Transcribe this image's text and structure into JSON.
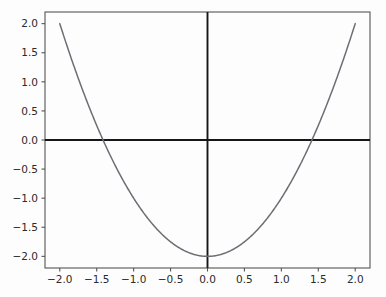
{
  "figure": {
    "background_color": "#fdfdfd",
    "width": 386,
    "height": 297
  },
  "chart_data": {
    "type": "line",
    "title": "",
    "xlabel": "",
    "ylabel": "",
    "expression": "y = x^2 - 2",
    "xlim": [
      -2.2,
      2.2
    ],
    "ylim": [
      -2.2,
      2.2
    ],
    "grid": false,
    "legend": null,
    "axis_lines": {
      "horizontal_at_y": 0.0,
      "vertical_at_x": 0.0,
      "color": "#161616"
    },
    "series": [
      {
        "name": "y = x^2 - 2",
        "color": "#6d6d75",
        "linewidth": 1.5,
        "x": [
          -2.0,
          -1.9,
          -1.8,
          -1.7,
          -1.6,
          -1.5,
          -1.4,
          -1.3,
          -1.2,
          -1.1,
          -1.0,
          -0.9,
          -0.8,
          -0.7,
          -0.6,
          -0.5,
          -0.4,
          -0.3,
          -0.2,
          -0.1,
          0.0,
          0.1,
          0.2,
          0.3,
          0.4,
          0.5,
          0.6,
          0.7,
          0.8,
          0.9,
          1.0,
          1.1,
          1.2,
          1.3,
          1.4,
          1.5,
          1.6,
          1.7,
          1.8,
          1.9,
          2.0
        ],
        "y": [
          2.0,
          1.61,
          1.24,
          0.89,
          0.56,
          0.25,
          -0.04,
          -0.31,
          -0.56,
          -0.79,
          -1.0,
          -1.19,
          -1.36,
          -1.51,
          -1.64,
          -1.75,
          -1.84,
          -1.91,
          -1.96,
          -1.99,
          -2.0,
          -1.99,
          -1.96,
          -1.91,
          -1.84,
          -1.75,
          -1.64,
          -1.51,
          -1.36,
          -1.19,
          -1.0,
          -0.79,
          -0.56,
          -0.31,
          -0.04,
          0.25,
          0.56,
          0.89,
          1.24,
          1.61,
          2.0
        ]
      }
    ],
    "x_ticks": [
      {
        "value": -2.0,
        "label": "−2.0"
      },
      {
        "value": -1.5,
        "label": "−1.5"
      },
      {
        "value": -1.0,
        "label": "−1.0"
      },
      {
        "value": -0.5,
        "label": "−0.5"
      },
      {
        "value": 0.0,
        "label": "0.0"
      },
      {
        "value": 0.5,
        "label": "0.5"
      },
      {
        "value": 1.0,
        "label": "1.0"
      },
      {
        "value": 1.5,
        "label": "1.5"
      },
      {
        "value": 2.0,
        "label": "2.0"
      }
    ],
    "y_ticks": [
      {
        "value": 2.0,
        "label": "2.0"
      },
      {
        "value": 1.5,
        "label": "1.5"
      },
      {
        "value": 1.0,
        "label": "1.0"
      },
      {
        "value": 0.5,
        "label": "0.5"
      },
      {
        "value": 0.0,
        "label": "0.0"
      },
      {
        "value": -0.5,
        "label": "−0.5"
      },
      {
        "value": -1.0,
        "label": "−1.0"
      },
      {
        "value": -1.5,
        "label": "−1.5"
      },
      {
        "value": -2.0,
        "label": "−2.0"
      }
    ],
    "roots": [
      -1.414,
      1.414
    ],
    "vertex": {
      "x": 0.0,
      "y": -2.0
    }
  }
}
